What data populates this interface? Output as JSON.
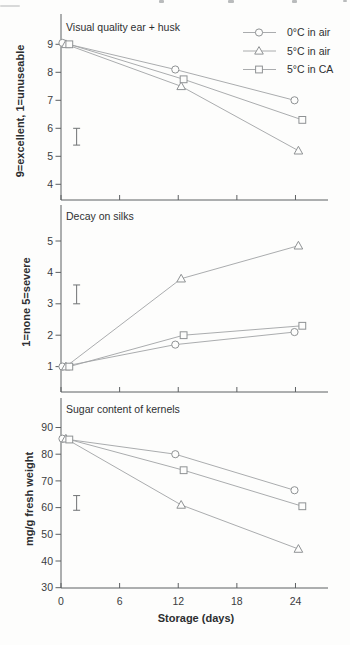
{
  "style": {
    "background": "#fdfdfc",
    "axis_color": "#5d6062",
    "series_line_color": "#a0a3a5",
    "marker_stroke_color": "#8f9294",
    "text_color": "#2e3032"
  },
  "legend": {
    "position": "top-right-inside-first-panel",
    "items": [
      {
        "label": "0°C in air",
        "marker": "circle"
      },
      {
        "label": "5°C in air",
        "marker": "triangle"
      },
      {
        "label": "5°C in CA",
        "marker": "square"
      }
    ]
  },
  "chart_data": [
    {
      "type": "line",
      "title": "Visual quality ear + husk",
      "ylabel": "9=excellent, 1=unuseable",
      "xlabel": "",
      "x": [
        0,
        12,
        24
      ],
      "xticks": [
        0,
        6,
        12,
        18,
        24
      ],
      "yticks": [
        4,
        5,
        6,
        7,
        8,
        9
      ],
      "ylim": [
        3.4,
        10.1
      ],
      "grid": false,
      "series": [
        {
          "name": "0°C in air",
          "marker": "circle",
          "values": [
            9.05,
            8.1,
            7.0
          ],
          "x_draw": [
            0.15,
            11.7,
            23.9
          ]
        },
        {
          "name": "5°C in air",
          "marker": "triangle",
          "values": [
            9.0,
            7.5,
            5.2
          ],
          "x_draw": [
            0.5,
            12.3,
            24.3
          ]
        },
        {
          "name": "5°C in CA",
          "marker": "square",
          "values": [
            9.0,
            7.75,
            6.3
          ],
          "x_draw": [
            0.85,
            12.55,
            24.7
          ]
        }
      ],
      "error_bar": {
        "x": 1.6,
        "low": 5.4,
        "high": 6.0
      }
    },
    {
      "type": "line",
      "title": "Decay on silks",
      "ylabel": "1=none  5=severe",
      "xlabel": "",
      "x": [
        0,
        12,
        24
      ],
      "xticks": [
        0,
        6,
        12,
        18,
        24
      ],
      "yticks": [
        1,
        2,
        3,
        4,
        5
      ],
      "ylim": [
        0.25,
        6.15
      ],
      "grid": false,
      "series": [
        {
          "name": "0°C in air",
          "marker": "circle",
          "values": [
            1.0,
            1.7,
            2.1
          ],
          "x_draw": [
            0.15,
            11.7,
            23.9
          ]
        },
        {
          "name": "5°C in air",
          "marker": "triangle",
          "values": [
            1.0,
            3.8,
            4.85
          ],
          "x_draw": [
            0.5,
            12.3,
            24.3
          ]
        },
        {
          "name": "5°C in CA",
          "marker": "square",
          "values": [
            1.0,
            2.0,
            2.3
          ],
          "x_draw": [
            0.85,
            12.55,
            24.7
          ]
        }
      ],
      "error_bar": {
        "x": 1.6,
        "low": 3.0,
        "high": 3.6
      }
    },
    {
      "type": "line",
      "title": "Sugar content of kernels",
      "ylabel": "mg/g fresh weight",
      "xlabel": "Storage (days)",
      "x": [
        0,
        12,
        24
      ],
      "xticks": [
        0,
        6,
        12,
        18,
        24
      ],
      "yticks": [
        30,
        40,
        50,
        60,
        70,
        80,
        90
      ],
      "ylim": [
        30,
        101
      ],
      "grid": false,
      "series": [
        {
          "name": "0°C in air",
          "marker": "circle",
          "values": [
            85.8,
            80.0,
            66.5
          ],
          "x_draw": [
            0.15,
            11.7,
            23.9
          ]
        },
        {
          "name": "5°C in air",
          "marker": "triangle",
          "values": [
            85.8,
            61.0,
            44.5
          ],
          "x_draw": [
            0.5,
            12.3,
            24.3
          ]
        },
        {
          "name": "5°C in CA",
          "marker": "square",
          "values": [
            85.5,
            74.0,
            60.5
          ],
          "x_draw": [
            0.85,
            12.55,
            24.7
          ]
        }
      ],
      "error_bar": {
        "x": 1.6,
        "low": 59.0,
        "high": 64.5
      }
    }
  ]
}
